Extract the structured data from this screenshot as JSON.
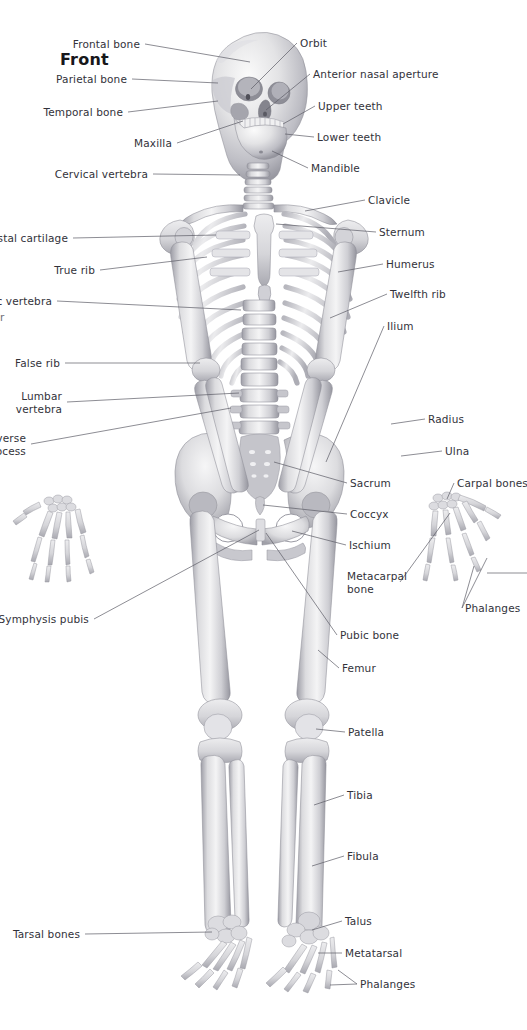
{
  "figure": {
    "title": "Front",
    "background_color": "#ffffff",
    "label_color": "#32323a",
    "leader_color": "#5c5c66",
    "bone_light": "#f2f2f2",
    "bone_mid": "#d8d8da",
    "bone_shadow": "#a9a9b0",
    "bone_dark": "#85858d"
  },
  "edge_fragment": {
    "text": "r"
  },
  "labels_left": [
    {
      "id": "frontal-bone",
      "text": "Frontal bone",
      "x": 140,
      "y": 38,
      "align": "right"
    },
    {
      "id": "parietal-bone",
      "text": "Parietal bone",
      "x": 127,
      "y": 73,
      "align": "right"
    },
    {
      "id": "temporal-bone",
      "text": "Temporal bone",
      "x": 123,
      "y": 106,
      "align": "right"
    },
    {
      "id": "maxilla",
      "text": "Maxilla",
      "x": 172,
      "y": 137,
      "align": "right"
    },
    {
      "id": "cervical-vertebra",
      "text": "Cervical vertebra",
      "x": 148,
      "y": 168,
      "align": "right"
    },
    {
      "id": "costal-cartilage",
      "text": "Costal cartilage",
      "x": 68,
      "y": 232,
      "align": "right"
    },
    {
      "id": "true-rib",
      "text": "True rib",
      "x": 95,
      "y": 264,
      "align": "right"
    },
    {
      "id": "thoracic-vertebra",
      "text": "Thoracic vertebra",
      "x": 52,
      "y": 295,
      "align": "right"
    },
    {
      "id": "false-rib",
      "text": "False rib",
      "x": 60,
      "y": 357,
      "align": "right"
    },
    {
      "id": "lumbar-vertebra",
      "text": "Lumbar\nvertebra",
      "x": 62,
      "y": 390,
      "align": "right"
    },
    {
      "id": "transverse-process",
      "text": "Transverse\nprocess",
      "x": 26,
      "y": 432,
      "align": "right"
    },
    {
      "id": "symphysis-pubis",
      "text": "Symphysis pubis",
      "x": 89,
      "y": 613,
      "align": "right"
    },
    {
      "id": "tarsal-bones",
      "text": "Tarsal bones",
      "x": 80,
      "y": 928,
      "align": "right"
    }
  ],
  "labels_right": [
    {
      "id": "orbit",
      "text": "Orbit",
      "x": 300,
      "y": 37,
      "align": "left"
    },
    {
      "id": "anterior-nasal-aperture",
      "text": "Anterior nasal aperture",
      "x": 313,
      "y": 68,
      "align": "left"
    },
    {
      "id": "upper-teeth",
      "text": "Upper teeth",
      "x": 318,
      "y": 100,
      "align": "left"
    },
    {
      "id": "lower-teeth",
      "text": "Lower teeth",
      "x": 317,
      "y": 131,
      "align": "left"
    },
    {
      "id": "mandible",
      "text": "Mandible",
      "x": 311,
      "y": 162,
      "align": "left"
    },
    {
      "id": "clavicle",
      "text": "Clavicle",
      "x": 368,
      "y": 194,
      "align": "left"
    },
    {
      "id": "sternum",
      "text": "Sternum",
      "x": 379,
      "y": 226,
      "align": "left"
    },
    {
      "id": "humerus",
      "text": "Humerus",
      "x": 386,
      "y": 258,
      "align": "left"
    },
    {
      "id": "twelfth-rib",
      "text": "Twelfth rib",
      "x": 390,
      "y": 288,
      "align": "left"
    },
    {
      "id": "ilium",
      "text": "Ilium",
      "x": 387,
      "y": 320,
      "align": "left"
    },
    {
      "id": "radius",
      "text": "Radius",
      "x": 428,
      "y": 413,
      "align": "left"
    },
    {
      "id": "ulna",
      "text": "Ulna",
      "x": 445,
      "y": 445,
      "align": "left"
    },
    {
      "id": "carpal-bones",
      "text": "Carpal bones",
      "x": 457,
      "y": 477,
      "align": "left"
    },
    {
      "id": "sacrum",
      "text": "Sacrum",
      "x": 350,
      "y": 477,
      "align": "left"
    },
    {
      "id": "coccyx",
      "text": "Coccyx",
      "x": 350,
      "y": 508,
      "align": "left"
    },
    {
      "id": "ischium",
      "text": "Ischium",
      "x": 349,
      "y": 539,
      "align": "left"
    },
    {
      "id": "metacarpal-bone",
      "text": "Metacarpal\nbone",
      "x": 347,
      "y": 570,
      "align": "left"
    },
    {
      "id": "phalanges-hand",
      "text": "Phalanges",
      "x": 465,
      "y": 602,
      "align": "left"
    },
    {
      "id": "pubic-bone",
      "text": "Pubic bone",
      "x": 340,
      "y": 629,
      "align": "left"
    },
    {
      "id": "femur",
      "text": "Femur",
      "x": 342,
      "y": 662,
      "align": "left"
    },
    {
      "id": "patella",
      "text": "Patella",
      "x": 348,
      "y": 726,
      "align": "left"
    },
    {
      "id": "tibia",
      "text": "Tibia",
      "x": 347,
      "y": 789,
      "align": "left"
    },
    {
      "id": "fibula",
      "text": "Fibula",
      "x": 347,
      "y": 850,
      "align": "left"
    },
    {
      "id": "talus",
      "text": "Talus",
      "x": 345,
      "y": 915,
      "align": "left"
    },
    {
      "id": "metatarsal",
      "text": "Metatarsal",
      "x": 345,
      "y": 947,
      "align": "left"
    },
    {
      "id": "phalanges-foot",
      "text": "Phalanges",
      "x": 360,
      "y": 978,
      "align": "left"
    }
  ]
}
